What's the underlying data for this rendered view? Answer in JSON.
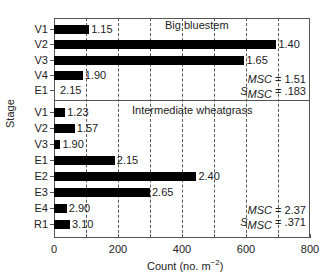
{
  "chart_data": {
    "type": "bar",
    "orientation": "horizontal",
    "xlabel": "Count (no. m⁻²)",
    "ylabel": "Stage",
    "xlim": [
      0,
      800
    ],
    "xticks": [
      0,
      200,
      400,
      600,
      800
    ],
    "grid": "dashed vertical lines every 100",
    "panels": [
      {
        "title": "Big bluestem",
        "categories": [
          "V1",
          "V2",
          "V3",
          "V4",
          "E1"
        ],
        "values": [
          110,
          695,
          595,
          90,
          0
        ],
        "bar_labels": [
          "1.15",
          "1.40",
          "1.65",
          "1.90",
          "2.15"
        ],
        "msc": "1.51",
        "s_msc": ".183"
      },
      {
        "title": "Intermediate wheatgrass",
        "categories": [
          "V1",
          "V2",
          "V3",
          "E1",
          "E2",
          "E3",
          "E4",
          "R1"
        ],
        "values": [
          35,
          65,
          20,
          190,
          445,
          300,
          40,
          50
        ],
        "bar_labels": [
          "1.23",
          "1.57",
          "1.90",
          "2.15",
          "2.40",
          "2.65",
          "2.90",
          "3.10"
        ],
        "msc": "2.37",
        "s_msc": ".371"
      }
    ]
  },
  "labels": {
    "xaxis_title_main": "Count (no. m",
    "xaxis_title_sup": "−2",
    "xaxis_title_end": ")",
    "yaxis_title": "Stage",
    "msc_label": "MSC",
    "s_label": "S",
    "s_sub": "MSC",
    "eq": " = "
  }
}
